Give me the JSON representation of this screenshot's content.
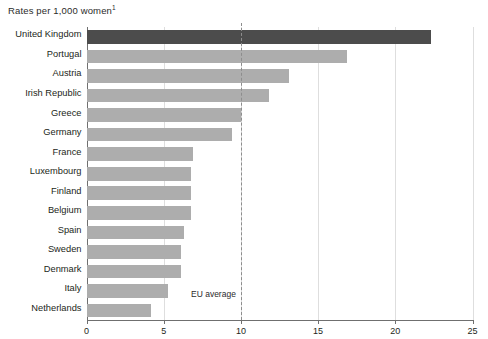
{
  "chart_data": {
    "type": "bar",
    "orientation": "horizontal",
    "title": "Rates per 1,000 women",
    "title_footnote_marker": "1",
    "xlabel": "",
    "ylabel": "",
    "xlim": [
      0,
      25
    ],
    "xticks": [
      0,
      5,
      10,
      15,
      20,
      25
    ],
    "xtick_labels": [
      "0",
      "5",
      "10",
      "15",
      "20",
      "25"
    ],
    "grid": true,
    "legend": "none",
    "categories": [
      "United Kingdom",
      "Portugal",
      "Austria",
      "Irish Republic",
      "Greece",
      "Germany",
      "France",
      "Luxembourg",
      "Finland",
      "Belgium",
      "Spain",
      "Sweden",
      "Denmark",
      "Italy",
      "Netherlands"
    ],
    "values": [
      22.3,
      16.9,
      13.1,
      11.8,
      10.0,
      9.4,
      6.9,
      6.8,
      6.8,
      6.8,
      6.3,
      6.1,
      6.1,
      5.3,
      4.2
    ],
    "highlight_category": "United Kingdom",
    "annotations": [
      {
        "name": "eu-average",
        "label": "EU average",
        "value": 10.0,
        "style": "dashed-vertical-line"
      }
    ],
    "colors": {
      "bar": "#adadad",
      "bar_highlight": "#4c4c4c",
      "axis": "#6f6f6f",
      "gridline": "#dedede",
      "reference_line": "#8d8d8d",
      "text": "#231f20",
      "background": "#ffffff"
    }
  }
}
